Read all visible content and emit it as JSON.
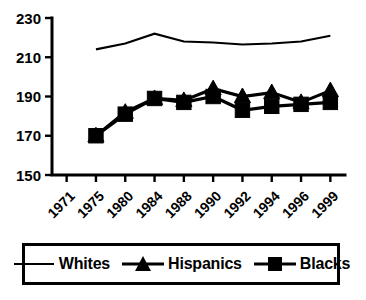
{
  "chart_data": {
    "type": "line",
    "title": "",
    "xlabel": "",
    "ylabel": "",
    "categories": [
      "1971",
      "1975",
      "1980",
      "1984",
      "1988",
      "1990",
      "1992",
      "1994",
      "1996",
      "1999"
    ],
    "x_tick_labels": [
      "1971",
      "1975",
      "1980",
      "1984",
      "1988",
      "1990",
      "1992",
      "1994",
      "1996",
      "1999"
    ],
    "y_tick_labels": [
      "150",
      "170",
      "190",
      "210",
      "230"
    ],
    "y_ticks": [
      150,
      170,
      190,
      210,
      230
    ],
    "ylim": [
      150,
      230
    ],
    "grid": false,
    "legend_position": "bottom",
    "series": [
      {
        "name": "Whites",
        "marker": "none",
        "color": "#000000",
        "values": [
          null,
          214,
          217,
          222,
          218,
          217.5,
          216.5,
          217,
          218,
          221
        ]
      },
      {
        "name": "Hispanics",
        "marker": "triangle",
        "color": "#000000",
        "values": [
          null,
          170,
          182,
          189,
          188,
          194,
          190,
          192,
          187,
          196
        ]
      },
      {
        "name": "Blacks",
        "marker": "square",
        "color": "#000000",
        "values": [
          null,
          170,
          181,
          189,
          187,
          190,
          183,
          185,
          186,
          191
        ]
      }
    ],
    "series_end_values": {
      "Hispanics_1999": 193,
      "Blacks_1999": 187
    }
  },
  "legend": {
    "entries": [
      {
        "label": "Whites",
        "swatch": "line-swatch"
      },
      {
        "label": "Hispanics",
        "swatch": "triangle-swatch"
      },
      {
        "label": "Blacks",
        "swatch": "square-swatch"
      }
    ]
  }
}
